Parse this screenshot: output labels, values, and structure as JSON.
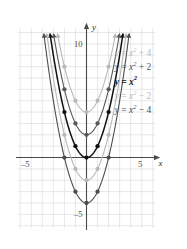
{
  "chart_data": {
    "type": "line",
    "title": "",
    "subtitle": "",
    "xlabel": "x",
    "ylabel": "y",
    "xlim": [
      -6.2,
      6.2
    ],
    "ylim": [
      -6.2,
      11.4
    ],
    "grid": true,
    "grid_spacing": 1,
    "grid_color": "#d8d8dc",
    "axis_color": "#4a4a4a",
    "legend_position": "right-inline-labels",
    "x_ticks": [
      -5,
      5
    ],
    "x_tick_labels": [
      "–5",
      "5"
    ],
    "y_ticks": [
      10,
      -5
    ],
    "y_tick_labels": [
      "10",
      "–5"
    ],
    "sample_x": [
      -2,
      -1,
      0,
      1,
      2
    ],
    "series": [
      {
        "name": "y = x² + 4",
        "label_lhs": "y",
        "label_op1": " = ",
        "label_var": "x",
        "label_exp": "2",
        "label_shift": " + 4",
        "shift": 4,
        "color": "#b9b9b9",
        "width": 1.1,
        "marker_color": "#b9b9b9",
        "values": [
          8,
          5,
          4,
          5,
          8
        ],
        "vertex": [
          0,
          4
        ]
      },
      {
        "name": "y = x² + 2",
        "label_lhs": "y",
        "label_op1": " = ",
        "label_var": "x",
        "label_exp": "2",
        "label_shift": " + 2",
        "shift": 2,
        "color": "#595959",
        "width": 1.1,
        "marker_color": "#595959",
        "values": [
          6,
          3,
          2,
          3,
          6
        ],
        "vertex": [
          0,
          2
        ]
      },
      {
        "name": "y = x²",
        "label_lhs": "y",
        "label_op1": " = ",
        "label_var": "x",
        "label_exp": "2",
        "label_shift": "",
        "shift": 0,
        "color": "#111111",
        "width": 1.5,
        "marker_color": "#111111",
        "values": [
          4,
          1,
          0,
          1,
          4
        ],
        "vertex": [
          0,
          0
        ]
      },
      {
        "name": "y = x² − 2",
        "label_lhs": "y",
        "label_op1": " = ",
        "label_var": "x",
        "label_exp": "2",
        "label_shift": " − 2",
        "shift": -2,
        "color": "#b9b9b9",
        "width": 1.1,
        "marker_color": "#b9b9b9",
        "values": [
          2,
          -1,
          -2,
          -1,
          2
        ],
        "vertex": [
          0,
          -2
        ]
      },
      {
        "name": "y = x² − 4",
        "label_lhs": "y",
        "label_op1": " = ",
        "label_var": "x",
        "label_exp": "2",
        "label_shift": " − 4",
        "shift": -4,
        "color": "#4d4d4d",
        "width": 1.1,
        "marker_color": "#4d4d4d",
        "values": [
          0,
          -3,
          -4,
          -3,
          0
        ],
        "vertex": [
          0,
          -4
        ]
      }
    ],
    "annotations": [
      {
        "text": "y = x² + 4",
        "x": 2.55,
        "y": 9.1
      },
      {
        "text": "y = x² + 2",
        "x": 2.55,
        "y": 7.9
      },
      {
        "text": "y = x²",
        "x": 2.55,
        "y": 6.6
      },
      {
        "text": "y = x² − 2",
        "x": 2.55,
        "y": 5.3
      },
      {
        "text": "y = x² − 4",
        "x": 2.55,
        "y": 4.1
      }
    ]
  }
}
